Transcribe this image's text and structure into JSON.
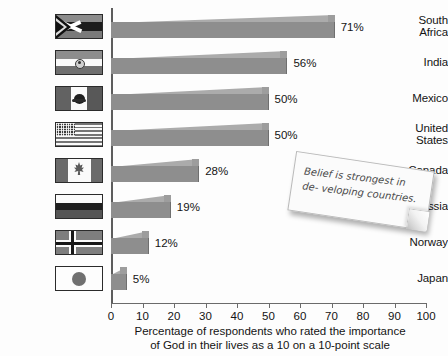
{
  "chart_data": {
    "type": "bar",
    "orientation": "horizontal",
    "title": "",
    "xlabel_lines": [
      "Percentage of respondents who rated the importance",
      "of God in their lives as a 10 on a 10-point scale"
    ],
    "ylabel": "",
    "xlim": [
      0,
      100
    ],
    "xticks": [
      0,
      10,
      20,
      30,
      40,
      50,
      60,
      70,
      80,
      90,
      100
    ],
    "grid": false,
    "legend": null,
    "categories": [
      "South Africa",
      "India",
      "Mexico",
      "United States",
      "Canada",
      "Russia",
      "Norway",
      "Japan"
    ],
    "values": [
      71,
      56,
      50,
      50,
      28,
      19,
      12,
      5
    ],
    "value_labels": [
      "71%",
      "56%",
      "50%",
      "50%",
      "28%",
      "19%",
      "12%",
      "5%"
    ],
    "annotations": [
      {
        "name": "sticky-note",
        "text_lines": [
          "Belief is strongest in de-",
          "veloping countries."
        ]
      }
    ],
    "colors": {
      "bar_face": "#8e8e8e",
      "bar_top": "#ababab",
      "bar_cap": "#9d9d9d",
      "axis": "#6b6b6b",
      "text": "#141414",
      "background": "#fdfdfd"
    }
  },
  "rows": [
    {
      "label_lines": [
        "South",
        "Africa"
      ],
      "flag_name": "flag-south-africa",
      "value_label": "71%",
      "value": 71
    },
    {
      "label_lines": [
        "India"
      ],
      "flag_name": "flag-india",
      "value_label": "56%",
      "value": 56
    },
    {
      "label_lines": [
        "Mexico"
      ],
      "flag_name": "flag-mexico",
      "value_label": "50%",
      "value": 50
    },
    {
      "label_lines": [
        "United",
        "States"
      ],
      "flag_name": "flag-united-states",
      "value_label": "50%",
      "value": 50
    },
    {
      "label_lines": [
        "Canada"
      ],
      "flag_name": "flag-canada",
      "value_label": "28%",
      "value": 28
    },
    {
      "label_lines": [
        "Russia"
      ],
      "flag_name": "flag-russia",
      "value_label": "19%",
      "value": 19
    },
    {
      "label_lines": [
        "Norway"
      ],
      "flag_name": "flag-norway",
      "value_label": "12%",
      "value": 12
    },
    {
      "label_lines": [
        "Japan"
      ],
      "flag_name": "flag-japan",
      "value_label": "5%",
      "value": 5
    }
  ],
  "axis": {
    "ticks": [
      "0",
      "10",
      "20",
      "30",
      "40",
      "50",
      "60",
      "70",
      "80",
      "90",
      "100"
    ],
    "caption_line1": "Percentage of respondents who rated the importance",
    "caption_line2": "of God in their lives as a 10 on a 10-point scale"
  },
  "note": {
    "line1": "Belief is strongest in de-",
    "line2": "veloping countries."
  }
}
